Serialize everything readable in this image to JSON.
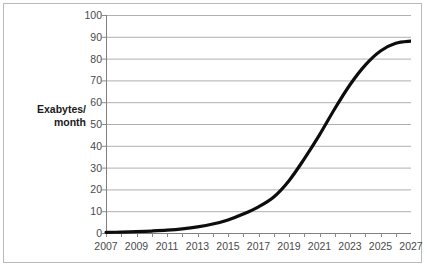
{
  "chart_data": {
    "type": "line",
    "title": "",
    "xlabel": "",
    "ylabel": "Exabytes/ month",
    "ylabel_line1": "Exabytes/",
    "ylabel_line2": "month",
    "xlim": [
      2007,
      2027
    ],
    "ylim": [
      0,
      100
    ],
    "grid": true,
    "legend": false,
    "line_color": "#0d0d0d",
    "grid_color": "#b0b0b0",
    "axis_color": "#808080",
    "tick_color": "#8a8a8a",
    "label_color": "#4a4a4a",
    "y_ticks": [
      0,
      10,
      20,
      30,
      40,
      50,
      60,
      70,
      80,
      90,
      100
    ],
    "y_tick_labels": [
      "0",
      "10",
      "20",
      "30",
      "40",
      "50",
      "60",
      "70",
      "80",
      "90",
      "100"
    ],
    "x_ticks": [
      2007,
      2008,
      2009,
      2010,
      2011,
      2012,
      2013,
      2014,
      2015,
      2016,
      2017,
      2018,
      2019,
      2020,
      2021,
      2022,
      2023,
      2024,
      2025,
      2026,
      2027
    ],
    "x_tick_labels_shown": [
      "2007",
      "2009",
      "2011",
      "2013",
      "2015",
      "2017",
      "2019",
      "2021",
      "2023",
      "2025",
      "2027"
    ],
    "x": [
      2007,
      2008,
      2009,
      2010,
      2011,
      2012,
      2013,
      2014,
      2015,
      2016,
      2017,
      2018,
      2019,
      2020,
      2021,
      2022,
      2023,
      2024,
      2025,
      2026,
      2027
    ],
    "values": [
      0.3,
      0.4,
      0.6,
      0.9,
      1.3,
      1.9,
      2.8,
      4.1,
      6.0,
      8.7,
      12.0,
      16.5,
      24.0,
      34.0,
      45.0,
      57.0,
      68.0,
      77.0,
      83.5,
      87.0,
      88.0
    ],
    "series": [
      {
        "name": "Global mobile data traffic",
        "values": [
          0.3,
          0.4,
          0.6,
          0.9,
          1.3,
          1.9,
          2.8,
          4.1,
          6.0,
          8.7,
          12.0,
          16.5,
          24.0,
          34.0,
          45.0,
          57.0,
          68.0,
          77.0,
          83.5,
          87.0,
          88.0
        ]
      }
    ]
  }
}
